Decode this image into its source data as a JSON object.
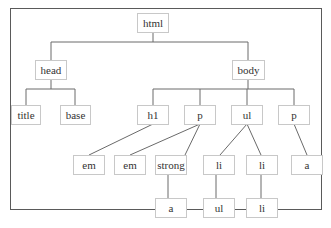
{
  "diagram": {
    "colors": {
      "frame": "#5a5a5a",
      "node_border": "#c8c8c8",
      "edge": "#6a6a6a",
      "text": "#333333",
      "background": "#ffffff"
    },
    "nodes": [
      {
        "id": "html",
        "label": "html",
        "level": 0
      },
      {
        "id": "head",
        "label": "head",
        "level": 1,
        "parent": "html"
      },
      {
        "id": "body",
        "label": "body",
        "level": 1,
        "parent": "html"
      },
      {
        "id": "title",
        "label": "title",
        "level": 2,
        "parent": "head"
      },
      {
        "id": "base",
        "label": "base",
        "level": 2,
        "parent": "head"
      },
      {
        "id": "h1",
        "label": "h1",
        "level": 2,
        "parent": "body"
      },
      {
        "id": "p1",
        "label": "p",
        "level": 2,
        "parent": "body"
      },
      {
        "id": "ul1",
        "label": "ul",
        "level": 2,
        "parent": "body"
      },
      {
        "id": "p2",
        "label": "p",
        "level": 2,
        "parent": "body"
      },
      {
        "id": "em1",
        "label": "em",
        "level": 3,
        "parent": "h1"
      },
      {
        "id": "em2",
        "label": "em",
        "level": 3,
        "parent": "p1"
      },
      {
        "id": "strong",
        "label": "strong",
        "level": 3,
        "parent": "p1"
      },
      {
        "id": "li1",
        "label": "li",
        "level": 3,
        "parent": "ul1"
      },
      {
        "id": "li2",
        "label": "li",
        "level": 3,
        "parent": "ul1"
      },
      {
        "id": "a1",
        "label": "a",
        "level": 3,
        "parent": "p2"
      },
      {
        "id": "a2",
        "label": "a",
        "level": 4,
        "parent": "strong"
      },
      {
        "id": "ul2",
        "label": "ul",
        "level": 4,
        "parent": "li1"
      },
      {
        "id": "li3",
        "label": "li",
        "level": 4,
        "parent": "li2"
      }
    ]
  }
}
